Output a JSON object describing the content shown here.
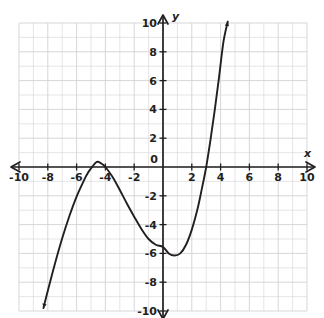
{
  "chart_data": {
    "type": "line",
    "title": "",
    "xlabel": "x",
    "ylabel": "y",
    "xlim": [
      -10,
      10
    ],
    "ylim": [
      -10,
      10
    ],
    "grid": true,
    "grid_step": 1,
    "tick_step": 2,
    "legend": "none",
    "x_tick_labels": [
      "-10",
      "-8",
      "-6",
      "-4",
      "-2",
      "0",
      "2",
      "4",
      "6",
      "8",
      "10"
    ],
    "x_tick_values": [
      -10,
      -8,
      -6,
      -4,
      -2,
      0,
      2,
      4,
      6,
      8,
      10
    ],
    "y_tick_labels": [
      "10",
      "8",
      "6",
      "4",
      "2",
      "-2",
      "-4",
      "-6",
      "-8",
      "-10"
    ],
    "y_tick_values": [
      10,
      8,
      6,
      4,
      2,
      -2,
      -4,
      -6,
      -8,
      -10
    ],
    "origin_label": "0",
    "curve_color": "#231f20",
    "grid_color": "#d3d3d6",
    "axis_color": "#231f20",
    "series": [
      {
        "name": "cubic-curve",
        "description": "cubic polynomial with arrowheads at both ends",
        "roots": [
          -5.3,
          -4.0,
          3.0
        ],
        "local_maximum": [
          -4.6,
          0.35
        ],
        "local_minimum": [
          0.8,
          -6.15
        ],
        "y_intercept": -5.5,
        "start_point": [
          -8.3,
          -9.8
        ],
        "end_point": [
          4.5,
          10.1
        ],
        "points": [
          [
            -8.3,
            -9.8
          ],
          [
            -8.0,
            -8.6
          ],
          [
            -7.5,
            -6.7
          ],
          [
            -7.0,
            -4.95
          ],
          [
            -6.5,
            -3.4
          ],
          [
            -6.0,
            -2.05
          ],
          [
            -5.5,
            -0.95
          ],
          [
            -5.3,
            -0.55
          ],
          [
            -5.0,
            -0.1
          ],
          [
            -4.6,
            0.35
          ],
          [
            -4.3,
            0.25
          ],
          [
            -4.0,
            0.0
          ],
          [
            -3.5,
            -0.7
          ],
          [
            -3.0,
            -1.6
          ],
          [
            -2.5,
            -2.55
          ],
          [
            -2.0,
            -3.45
          ],
          [
            -1.5,
            -4.3
          ],
          [
            -1.0,
            -5.0
          ],
          [
            -0.5,
            -5.4
          ],
          [
            0.0,
            -5.55
          ],
          [
            0.4,
            -6.0
          ],
          [
            0.8,
            -6.15
          ],
          [
            1.2,
            -6.0
          ],
          [
            1.6,
            -5.4
          ],
          [
            2.0,
            -4.35
          ],
          [
            2.4,
            -2.9
          ],
          [
            2.7,
            -1.5
          ],
          [
            3.0,
            0.0
          ],
          [
            3.3,
            1.9
          ],
          [
            3.6,
            4.0
          ],
          [
            3.9,
            6.3
          ],
          [
            4.2,
            8.7
          ],
          [
            4.5,
            10.1
          ]
        ]
      }
    ]
  },
  "axes": {
    "x_axis_name": "x",
    "y_axis_name": "y",
    "x_arrow_left": "left-arrow",
    "x_arrow_right": "right-arrow",
    "y_arrow_up": "up-arrow",
    "y_arrow_down": "down-arrow"
  }
}
